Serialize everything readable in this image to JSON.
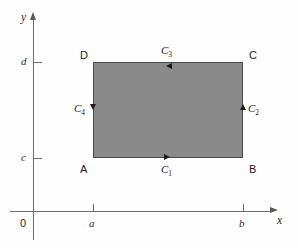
{
  "chart_data": {
    "type": "diagram",
    "title": "",
    "xlabel": "x",
    "ylabel": "y",
    "origin_label": "0",
    "grid": false,
    "legend": "none",
    "x_ticks": [
      {
        "label": "a",
        "position": 93
      },
      {
        "label": "b",
        "position": 243
      }
    ],
    "y_ticks": [
      {
        "label": "c",
        "position": 158
      },
      {
        "label": "d",
        "position": 62
      }
    ],
    "region": {
      "fill_color": "#8a8a8a",
      "border_color": "#4a4a4a",
      "x_from": "a",
      "x_to": "b",
      "y_from": "c",
      "y_to": "d"
    },
    "vertices": [
      {
        "name": "A",
        "x": "a",
        "y": "c"
      },
      {
        "name": "B",
        "x": "b",
        "y": "c"
      },
      {
        "name": "C",
        "x": "b",
        "y": "d"
      },
      {
        "name": "D",
        "x": "a",
        "y": "d"
      }
    ],
    "curves": [
      {
        "name": "C",
        "subscript": "1",
        "edge": "bottom",
        "from": "A",
        "to": "B",
        "direction": "right"
      },
      {
        "name": "C",
        "subscript": "2",
        "edge": "right",
        "from": "B",
        "to": "C",
        "direction": "up"
      },
      {
        "name": "C",
        "subscript": "3",
        "edge": "top",
        "from": "C",
        "to": "D",
        "direction": "left"
      },
      {
        "name": "C",
        "subscript": "4",
        "edge": "left",
        "from": "D",
        "to": "A",
        "direction": "down"
      }
    ]
  },
  "axes": {
    "x_label": "x",
    "y_label": "y",
    "origin": "0"
  },
  "ticks": {
    "a": "a",
    "b": "b",
    "c": "c",
    "d": "d"
  },
  "vertices": {
    "A": "A",
    "B": "B",
    "C": "C",
    "D": "D"
  },
  "curves": {
    "c1_base": "C",
    "c1_sub": "1",
    "c2_base": "C",
    "c2_sub": "2",
    "c3_base": "C",
    "c3_sub": "3",
    "c4_base": "C",
    "c4_sub": "4"
  },
  "colors": {
    "region_fill": "#8a8a8a",
    "region_border": "#4a4a4a",
    "axis": "#6e6e6e",
    "text": "#1c1c1c",
    "background": "#fefefe"
  }
}
